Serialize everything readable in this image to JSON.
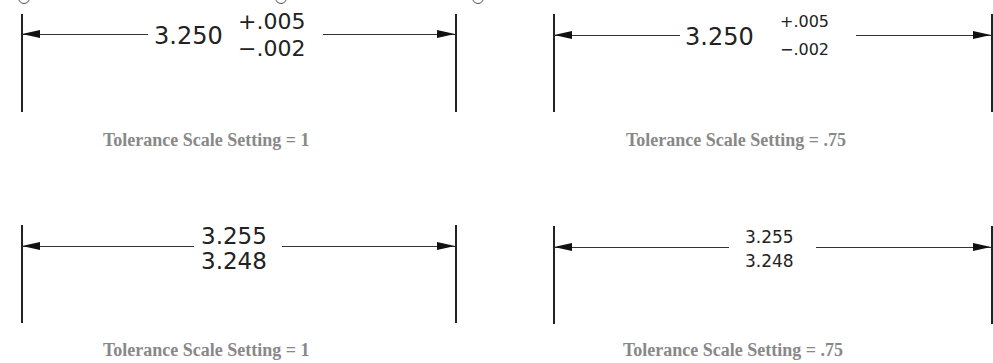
{
  "figure": {
    "panels": [
      {
        "id": "plus-minus-scale-1",
        "style": "deviation",
        "nominal": "3.250",
        "upper": "+.005",
        "lower": "−.002",
        "caption": "Tolerance Scale Setting = 1"
      },
      {
        "id": "plus-minus-scale-075",
        "style": "deviation",
        "nominal": "3.250",
        "upper": "+.005",
        "lower": "−.002",
        "caption": "Tolerance Scale Setting = .75"
      },
      {
        "id": "limits-scale-1",
        "style": "limits",
        "upper": "3.255",
        "lower": "3.248",
        "caption": "Tolerance Scale Setting = 1"
      },
      {
        "id": "limits-scale-075",
        "style": "limits",
        "upper": "3.255",
        "lower": "3.248",
        "caption": "Tolerance Scale Setting = .75"
      }
    ]
  }
}
